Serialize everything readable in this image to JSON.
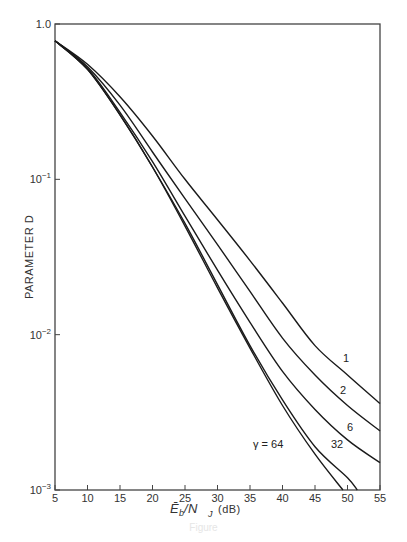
{
  "chart_data": {
    "type": "line",
    "title": "",
    "xlabel": "E_b / N_J (dB)",
    "ylabel": "PARAMETER D",
    "xlim": [
      5,
      55
    ],
    "ylim": [
      0.001,
      1.0
    ],
    "yscale": "log",
    "grid": false,
    "legend": "inline labels at curve ends",
    "x_ticks": [
      5,
      10,
      15,
      20,
      25,
      30,
      35,
      40,
      45,
      50,
      55
    ],
    "y_ticks": [
      {
        "value": 1.0,
        "label": "1.0"
      },
      {
        "value": 0.1,
        "label": "10^-1"
      },
      {
        "value": 0.01,
        "label": "10^-2"
      },
      {
        "value": 0.001,
        "label": "10^-3"
      }
    ],
    "series": [
      {
        "name": "1",
        "label": "1",
        "x": [
          5,
          10,
          15,
          20,
          25,
          30,
          35,
          40,
          45,
          50,
          55
        ],
        "values": [
          0.78,
          0.55,
          0.34,
          0.19,
          0.1,
          0.055,
          0.03,
          0.016,
          0.0085,
          0.0055,
          0.0036
        ]
      },
      {
        "name": "2",
        "label": "2",
        "x": [
          5,
          10,
          15,
          20,
          25,
          30,
          35,
          40,
          45,
          50,
          55
        ],
        "values": [
          0.78,
          0.53,
          0.3,
          0.15,
          0.075,
          0.038,
          0.019,
          0.0095,
          0.0055,
          0.0035,
          0.0024
        ]
      },
      {
        "name": "6",
        "label": "6",
        "x": [
          5,
          10,
          15,
          20,
          25,
          30,
          35,
          40,
          45,
          50,
          55
        ],
        "values": [
          0.78,
          0.52,
          0.27,
          0.13,
          0.058,
          0.026,
          0.012,
          0.0058,
          0.0033,
          0.0021,
          0.0015
        ]
      },
      {
        "name": "32",
        "label": "32",
        "x": [
          5,
          10,
          15,
          20,
          25,
          30,
          35,
          40,
          45,
          50,
          51.5
        ],
        "values": [
          0.78,
          0.51,
          0.26,
          0.12,
          0.052,
          0.021,
          0.0085,
          0.0038,
          0.0019,
          0.0012,
          0.001
        ]
      },
      {
        "name": "64",
        "label": "γ = 64",
        "x": [
          5,
          10,
          15,
          20,
          25,
          30,
          35,
          40,
          45,
          49.3
        ],
        "values": [
          0.78,
          0.51,
          0.26,
          0.12,
          0.05,
          0.02,
          0.0082,
          0.0035,
          0.0017,
          0.001
        ]
      }
    ]
  },
  "axes": {
    "x_title_main": "Ē",
    "x_title_sub_b": "b",
    "x_title_slash": " /N",
    "x_title_sub_j": "J",
    "x_title_unit": "(dB)",
    "y_title": "PARAMETER D"
  },
  "caption": "Figure"
}
